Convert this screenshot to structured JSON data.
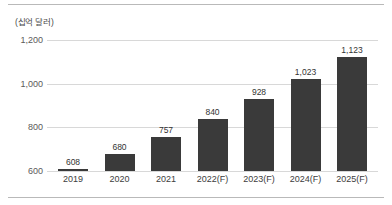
{
  "chart_data": {
    "type": "bar",
    "title": "",
    "subtitle": "",
    "unit_label": "(십억 달러)",
    "xlabel": "",
    "ylabel": "",
    "categories": [
      "2019",
      "2020",
      "2021",
      "2022(F)",
      "2023(F)",
      "2024(F)",
      "2025(F)"
    ],
    "values": [
      608,
      680,
      757,
      840,
      928,
      1023,
      1123
    ],
    "value_labels": [
      "608",
      "680",
      "757",
      "840",
      "928",
      "1,023",
      "1,123"
    ],
    "ylim": [
      600,
      1200
    ],
    "yticks": [
      600,
      800,
      1000,
      1200
    ],
    "ytick_labels": [
      "600",
      "800",
      "1,000",
      "1,200"
    ],
    "grid": true,
    "legend": "none",
    "series": [
      {
        "name": "",
        "values": [
          608,
          680,
          757,
          840,
          928,
          1023,
          1123
        ]
      }
    ],
    "colors": {
      "bar": "#3a3a3a",
      "grid": "#d8d8d8",
      "frame": "#b9b9b9",
      "tick_text": "#5a5a5a",
      "label_text": "#333333",
      "background": "#ffffff"
    }
  }
}
